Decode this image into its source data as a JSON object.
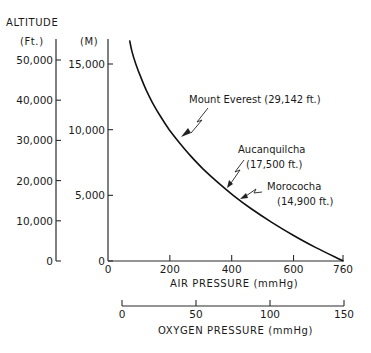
{
  "chart_data": {
    "type": "line",
    "title": "",
    "left_axes": {
      "header": "ALTITUDE",
      "feet": {
        "unit_label": "(Ft.)",
        "ticks": [
          0,
          10000,
          20000,
          30000,
          40000,
          50000
        ],
        "tick_labels": [
          "0",
          "10,000",
          "20,000",
          "30,000",
          "40,000",
          "50,000"
        ],
        "range": [
          0,
          50000
        ]
      },
      "meters": {
        "unit_label": "(M)",
        "ticks": [
          0,
          5000,
          10000,
          15000
        ],
        "tick_labels": [
          "0",
          "5,000",
          "10,000",
          "15,000"
        ],
        "range": [
          0,
          17000
        ]
      }
    },
    "x_axis": {
      "label": "AIR PRESSURE (mmHg)",
      "ticks": [
        0,
        200,
        400,
        600,
        760
      ],
      "tick_labels": [
        "0",
        "200",
        "400",
        "600",
        "760"
      ],
      "range": [
        0,
        760
      ]
    },
    "x2_axis": {
      "label": "OXYGEN PRESSURE (mmHg)",
      "ticks": [
        0,
        50,
        100,
        150
      ],
      "tick_labels": [
        "0",
        "50",
        "100",
        "150"
      ],
      "range": [
        0,
        150
      ]
    },
    "series": [
      {
        "name": "Air pressure vs altitude",
        "x_air_pressure_mmHg": [
          760,
          674,
          596,
          526,
          462,
          405,
          354,
          308,
          267,
          231,
          198,
          170,
          145,
          124,
          106,
          90,
          77,
          70
        ],
        "y_altitude_m": [
          0,
          1000,
          2000,
          3000,
          4000,
          5000,
          6000,
          7000,
          8000,
          9000,
          10000,
          11000,
          12000,
          13000,
          14000,
          15000,
          16000,
          16800
        ]
      }
    ],
    "annotations": [
      {
        "name": "Mount Everest",
        "text": "Mount Everest (29,142 ft.)",
        "altitude_ft": 29142,
        "altitude_m": 8882,
        "air_pressure_mmHg": 236
      },
      {
        "name": "Aucanquilcha",
        "line1": "Aucanquilcha",
        "line2": "(17,500 ft.)",
        "altitude_ft": 17500,
        "altitude_m": 5334,
        "air_pressure_mmHg": 388
      },
      {
        "name": "Morococha",
        "line1": "Morococha",
        "line2": "(14,900 ft.)",
        "altitude_ft": 14900,
        "altitude_m": 4542,
        "air_pressure_mmHg": 430
      }
    ],
    "grid": false,
    "legend": "none"
  }
}
